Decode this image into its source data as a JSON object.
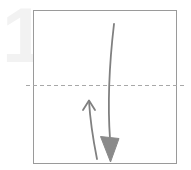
{
  "diagram": {
    "type": "origami-instruction-step",
    "step_number": "1",
    "canvas": {
      "width": 191,
      "height": 170,
      "background": "#ffffff"
    },
    "colors": {
      "step_number": "#f2f2f2",
      "paper_outline": "#9a9a9a",
      "fold_line": "#a8a8a8",
      "arrow_stroke": "#808080",
      "arrow_fill": "#8a8a8a",
      "background": "#ffffff"
    },
    "paper": {
      "name": "square-sheet",
      "shape": "square",
      "x": 33,
      "y": 10,
      "width": 144,
      "height": 154,
      "stroke_width": 1
    },
    "fold_line": {
      "name": "horizontal-valley-fold-line",
      "style": "dashed",
      "orientation": "horizontal",
      "y": 85,
      "x_start": 26,
      "x_end": 186,
      "dash": "4 3",
      "stroke_width": 1
    },
    "arrows": [
      {
        "name": "fold-arrow-down",
        "direction": "down",
        "head_style": "filled-triangle",
        "path": "M 114 24 C 110 58, 108 96, 110 140",
        "head_points": "100,137 119,137 110,162",
        "stroke_width": 1.8
      },
      {
        "name": "unfold-arrow-up",
        "direction": "up",
        "head_style": "open-chevron",
        "path": "M 96 158 C 92 126, 90 118, 89 101",
        "head_points": "83,110 89,100 95,110",
        "stroke_width": 1.8
      }
    ],
    "labels": {
      "step_caption": "1",
      "fold_label": "valley fold",
      "motion_label": "fold then unfold"
    }
  }
}
